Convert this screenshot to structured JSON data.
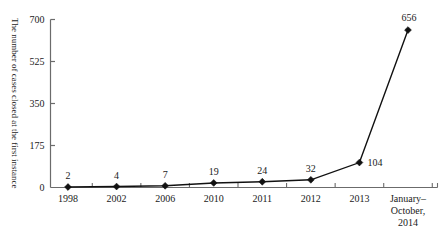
{
  "chart_data": {
    "type": "line",
    "title": "",
    "xlabel": "",
    "ylabel": "The number of cases closed at the first instance",
    "categories": [
      "1998",
      "2002",
      "2006",
      "2010",
      "2011",
      "2012",
      "2013",
      "January–\nOctober,\n2014"
    ],
    "category_lines": [
      [
        "1998"
      ],
      [
        "2002"
      ],
      [
        "2006"
      ],
      [
        "2010"
      ],
      [
        "2011"
      ],
      [
        "2012"
      ],
      [
        "2013"
      ],
      [
        "January–",
        "October,",
        "2014"
      ]
    ],
    "values": [
      2,
      4,
      7,
      19,
      24,
      32,
      104,
      656
    ],
    "value_labels": [
      "2",
      "4",
      "7",
      "19",
      "24",
      "32",
      "104",
      "656"
    ],
    "ylim": [
      0,
      700
    ],
    "yticks": [
      0,
      175,
      350,
      525,
      700
    ],
    "ytick_labels": [
      "0",
      "175",
      "350",
      "525",
      "700"
    ],
    "grid": false,
    "legend": false,
    "marker": "diamond",
    "line_color": "#111111",
    "marker_color": "#111111",
    "axis_color": "#6b6b6b",
    "text_color": "#1a1a1a"
  }
}
